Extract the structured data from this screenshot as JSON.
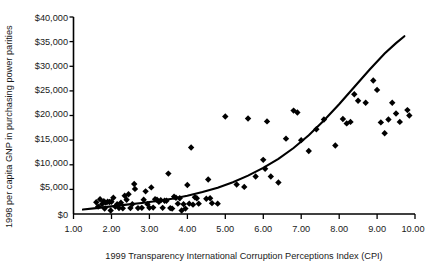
{
  "chart_data": {
    "type": "scatter",
    "title": "",
    "xlabel": "1999 Transparency International Corruption Perceptions Index (CPI)",
    "ylabel": "1998 per capita GNP in purchasing power parities",
    "xlim": [
      1.0,
      10.0
    ],
    "ylim": [
      0,
      40000
    ],
    "grid": false,
    "legend": null,
    "xticks": [
      1.0,
      2.0,
      3.0,
      4.0,
      5.0,
      6.0,
      7.0,
      8.0,
      9.0,
      10.0
    ],
    "xtick_labels": [
      "1.00",
      "2.00",
      "3.00",
      "4.00",
      "5.00",
      "6.00",
      "7.00",
      "8.00",
      "9.00",
      "10.00"
    ],
    "yticks": [
      0,
      5000,
      10000,
      15000,
      20000,
      25000,
      30000,
      35000,
      40000
    ],
    "ytick_labels": [
      "$0",
      "$5,000",
      "$10,000",
      "$15,000",
      "$20,000",
      "$25,000",
      "$30,000",
      "$35,000",
      "$40,000"
    ],
    "marker": "diamond",
    "marker_color": "#000000",
    "marker_size": 4.2,
    "points": [
      [
        1.6,
        2400
      ],
      [
        1.65,
        1500
      ],
      [
        1.7,
        3000
      ],
      [
        1.75,
        2000
      ],
      [
        1.8,
        2600
      ],
      [
        1.82,
        1100
      ],
      [
        1.85,
        2300
      ],
      [
        1.9,
        2500
      ],
      [
        1.95,
        2450
      ],
      [
        1.98,
        700
      ],
      [
        2.0,
        2500
      ],
      [
        2.05,
        3300
      ],
      [
        2.1,
        1500
      ],
      [
        2.15,
        2000
      ],
      [
        2.2,
        1200
      ],
      [
        2.25,
        2300
      ],
      [
        2.3,
        1150
      ],
      [
        2.35,
        3700
      ],
      [
        2.4,
        2900
      ],
      [
        2.45,
        4000
      ],
      [
        2.5,
        1200
      ],
      [
        2.55,
        2000
      ],
      [
        2.6,
        6100
      ],
      [
        2.62,
        5100
      ],
      [
        2.7,
        1200
      ],
      [
        2.8,
        1250
      ],
      [
        2.85,
        2900
      ],
      [
        2.9,
        4600
      ],
      [
        2.95,
        2000
      ],
      [
        3.0,
        1250
      ],
      [
        3.05,
        5400
      ],
      [
        3.1,
        1300
      ],
      [
        3.15,
        3000
      ],
      [
        3.2,
        2900
      ],
      [
        3.25,
        2500
      ],
      [
        3.3,
        2800
      ],
      [
        3.35,
        1250
      ],
      [
        3.4,
        2700
      ],
      [
        3.45,
        2700
      ],
      [
        3.5,
        8200
      ],
      [
        3.55,
        1200
      ],
      [
        3.6,
        1100
      ],
      [
        3.65,
        3500
      ],
      [
        3.7,
        3300
      ],
      [
        3.75,
        2100
      ],
      [
        3.8,
        3200
      ],
      [
        3.85,
        700
      ],
      [
        3.9,
        2000
      ],
      [
        3.95,
        1100
      ],
      [
        4.0,
        5900
      ],
      [
        4.05,
        2100
      ],
      [
        4.1,
        13500
      ],
      [
        4.15,
        1900
      ],
      [
        4.2,
        3400
      ],
      [
        4.25,
        3200
      ],
      [
        4.3,
        2100
      ],
      [
        4.5,
        3100
      ],
      [
        4.55,
        7000
      ],
      [
        4.6,
        3200
      ],
      [
        4.65,
        2200
      ],
      [
        4.8,
        2100
      ],
      [
        5.0,
        19800
      ],
      [
        5.3,
        6000
      ],
      [
        5.5,
        5500
      ],
      [
        5.6,
        19400
      ],
      [
        5.8,
        7600
      ],
      [
        6.0,
        11000
      ],
      [
        6.05,
        9200
      ],
      [
        6.1,
        18800
      ],
      [
        6.2,
        7600
      ],
      [
        6.4,
        6400
      ],
      [
        6.6,
        15300
      ],
      [
        6.8,
        21000
      ],
      [
        6.9,
        20600
      ],
      [
        7.0,
        15000
      ],
      [
        7.2,
        12800
      ],
      [
        7.4,
        17200
      ],
      [
        7.6,
        19200
      ],
      [
        7.9,
        13900
      ],
      [
        8.1,
        19300
      ],
      [
        8.2,
        18400
      ],
      [
        8.3,
        18700
      ],
      [
        8.4,
        24300
      ],
      [
        8.5,
        23000
      ],
      [
        8.7,
        22600
      ],
      [
        8.9,
        27100
      ],
      [
        9.0,
        25200
      ],
      [
        9.1,
        18600
      ],
      [
        9.2,
        16400
      ],
      [
        9.3,
        19200
      ],
      [
        9.4,
        22600
      ],
      [
        9.5,
        20400
      ],
      [
        9.6,
        18700
      ],
      [
        9.8,
        21100
      ],
      [
        9.85,
        20000
      ]
    ],
    "trendline": {
      "description": "exponential best-fit curve",
      "color": "#000000",
      "x_start": 1.25,
      "x_end": 9.72,
      "y_start": 900,
      "y_end": 36100,
      "points": [
        [
          1.25,
          900
        ],
        [
          1.6,
          1200
        ],
        [
          2.0,
          1550
        ],
        [
          2.4,
          1900
        ],
        [
          2.8,
          2250
        ],
        [
          3.2,
          2650
        ],
        [
          3.6,
          3100
        ],
        [
          4.0,
          3700
        ],
        [
          4.4,
          4450
        ],
        [
          4.8,
          5350
        ],
        [
          5.2,
          6450
        ],
        [
          5.6,
          7800
        ],
        [
          6.0,
          9350
        ],
        [
          6.4,
          11200
        ],
        [
          6.8,
          13400
        ],
        [
          7.2,
          16000
        ],
        [
          7.6,
          19000
        ],
        [
          8.0,
          22300
        ],
        [
          8.4,
          25800
        ],
        [
          8.8,
          29300
        ],
        [
          9.2,
          32600
        ],
        [
          9.5,
          34700
        ],
        [
          9.72,
          36100
        ]
      ]
    }
  }
}
